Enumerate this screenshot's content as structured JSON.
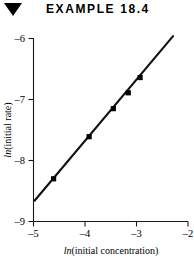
{
  "header": {
    "bullet_icon": "triangle-down-icon",
    "title": "EXAMPLE 18.4"
  },
  "chart_data": {
    "type": "scatter",
    "title": "",
    "subtitle": "",
    "xlabel_prefix": "ln",
    "xlabel_rest": "(initial concentration)",
    "ylabel_prefix": "ln",
    "ylabel_rest": "(initial rate)",
    "xlabel": "ln(initial concentration)",
    "ylabel": "ln(initial rate)",
    "xlim": [
      -5,
      -2
    ],
    "ylim": [
      -9,
      -6
    ],
    "xticks": [
      -5,
      -4,
      -3,
      -2
    ],
    "yticks": [
      -9,
      -8,
      -7,
      -6
    ],
    "xtick_labels": [
      "–5",
      "–4",
      "–3",
      "–2"
    ],
    "ytick_labels": [
      "–9",
      "–8",
      "–7",
      "–6"
    ],
    "grid": false,
    "legend": "none",
    "series": [
      {
        "name": "initial rate vs concentration",
        "marker": "filled-square",
        "x": [
          -4.61,
          -3.92,
          -3.45,
          -3.16,
          -2.93
        ],
        "y": [
          -8.3,
          -7.61,
          -7.15,
          -6.89,
          -6.64
        ]
      }
    ],
    "fit_line": {
      "name": "best-fit line",
      "x": [
        -4.98,
        -2.29
      ],
      "y": [
        -8.66,
        -5.96
      ],
      "slope": 1.0,
      "intercept": -3.68
    }
  }
}
